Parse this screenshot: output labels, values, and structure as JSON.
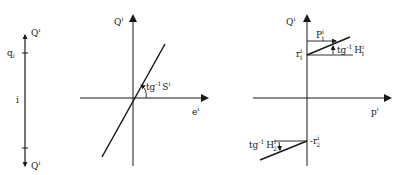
{
  "colors": {
    "ink": "#1a1a1a",
    "background": "#ffffff"
  },
  "left_panel": {
    "top_force_label": "Q",
    "top_force_sup": "i",
    "node_label": "q",
    "node_sub": "i",
    "element_label": "i",
    "bottom_force_label": "Q",
    "bottom_force_sup": "i"
  },
  "middle_panel": {
    "y_axis_label": "Q",
    "y_axis_sup": "i",
    "x_axis_label": "e",
    "x_axis_sup": "i",
    "slope_label": "tg",
    "slope_exp": "-1",
    "slope_symbol": "S",
    "slope_sup": "i"
  },
  "right_panel": {
    "y_axis_label": "Q",
    "y_axis_sup": "i",
    "x_axis_label": "p",
    "x_axis_sup": "i",
    "upper_limit_label": "P",
    "upper_limit_sup": "i",
    "upper_limit_sub": "1",
    "r1_label": "r",
    "r1_sup": "i",
    "r1_sub": "1",
    "h1_label": "tg",
    "h1_exp": "-1",
    "h1_symbol": "H",
    "h1_sup": "i",
    "h1_sub": "1",
    "r2_label": "-r",
    "r2_sup": "i",
    "r2_sub": "2",
    "h2_label": "tg",
    "h2_exp": "-1",
    "h2_symbol": "H",
    "h2_sup": "i",
    "h2_sub": "2"
  }
}
